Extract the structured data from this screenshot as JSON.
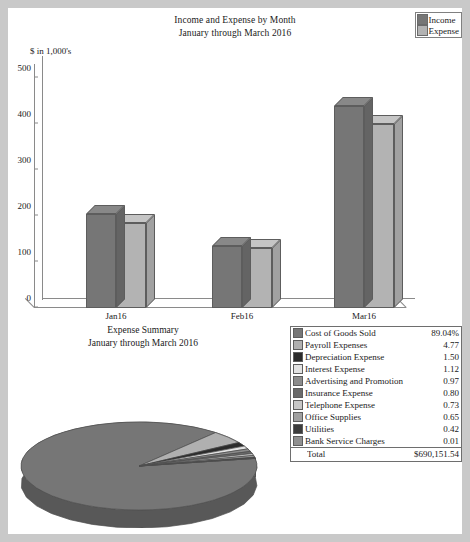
{
  "bar_chart": {
    "title_line1": "Income and Expense by Month",
    "title_line2": "January through March 2016",
    "axis_unit": "$ in 1,000's",
    "legend": [
      {
        "label": "Income",
        "color": "#767676"
      },
      {
        "label": "Expense",
        "color": "#b3b3b3"
      }
    ]
  },
  "pie_section": {
    "title_line1": "Expense Summary",
    "title_line2": "January through March 2016"
  },
  "table": {
    "rows": [
      {
        "label": "Cost of Goods Sold",
        "value": "89.04%",
        "color": "#767676"
      },
      {
        "label": "Payroll Expenses",
        "value": "4.77",
        "color": "#b0b0b0"
      },
      {
        "label": "Depreciation Expense",
        "value": "1.50",
        "color": "#2b2b2b"
      },
      {
        "label": "Interest Expense",
        "value": "1.12",
        "color": "#e2e2e2"
      },
      {
        "label": "Advertising and Promotion",
        "value": "0.97",
        "color": "#8c8c8c"
      },
      {
        "label": "Insurance Expense",
        "value": "0.80",
        "color": "#6a6a6a"
      },
      {
        "label": "Telephone Expense",
        "value": "0.73",
        "color": "#c6c6c6"
      },
      {
        "label": "Office Supplies",
        "value": "0.65",
        "color": "#a0a0a0"
      },
      {
        "label": "Utilities",
        "value": "0.42",
        "color": "#3c3c3c"
      },
      {
        "label": "Bank Service Charges",
        "value": "0.01",
        "color": "#8f8f8f"
      }
    ],
    "total_label": "Total",
    "total_value": "$690,151.54"
  },
  "chart_data": [
    {
      "type": "bar",
      "title": "Income and Expense by Month\nJanuary through March 2016",
      "xlabel": "",
      "ylabel": "$ in 1,000's",
      "ylim": [
        0,
        500
      ],
      "yticks": [
        0,
        100,
        200,
        300,
        400,
        500
      ],
      "grid": false,
      "legend_position": "top-right",
      "categories": [
        "Jan16",
        "Feb16",
        "Mar16"
      ],
      "series": [
        {
          "name": "Income",
          "values": [
            205,
            135,
            440
          ],
          "color": "#767676"
        },
        {
          "name": "Expense",
          "values": [
            185,
            130,
            400
          ],
          "color": "#b3b3b3"
        }
      ]
    },
    {
      "type": "pie",
      "title": "Expense Summary\nJanuary through March 2016",
      "legend_position": "right-table",
      "total": "$690,151.54",
      "labels": [
        "Cost of Goods Sold",
        "Payroll Expenses",
        "Depreciation Expense",
        "Interest Expense",
        "Advertising and Promotion",
        "Insurance Expense",
        "Telephone Expense",
        "Office Supplies",
        "Utilities",
        "Bank Service Charges"
      ],
      "values": [
        89.04,
        4.77,
        1.5,
        1.12,
        0.97,
        0.8,
        0.73,
        0.65,
        0.42,
        0.01
      ],
      "colors": [
        "#767676",
        "#b0b0b0",
        "#2b2b2b",
        "#e2e2e2",
        "#8c8c8c",
        "#6a6a6a",
        "#c6c6c6",
        "#a0a0a0",
        "#3c3c3c",
        "#8f8f8f"
      ]
    }
  ]
}
